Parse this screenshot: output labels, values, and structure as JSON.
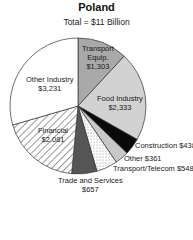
{
  "chart_data": {
    "type": "pie",
    "title": "Poland",
    "subtitle": "Total = $11 Billion",
    "unit": "$ Million",
    "start": "top, clockwise",
    "slices": [
      {
        "label": "Transport Equip.",
        "value": 1303,
        "value_label": "$1,303",
        "fill": "#a9a9a9",
        "pattern": "solid"
      },
      {
        "label": "Food Industry",
        "value": 2333,
        "value_label": "$2,333",
        "fill": "#d2d2d2",
        "pattern": "solid"
      },
      {
        "label": "Construction",
        "value": 438,
        "value_label": "$438",
        "fill": "#0a0a0a",
        "pattern": "solid"
      },
      {
        "label": "Other",
        "value": 361,
        "value_label": "$361",
        "fill": "#c8c8c8",
        "pattern": "solid"
      },
      {
        "label": "Transport/Telecom",
        "value": 548,
        "value_label": "$548",
        "fill": "#ffffff",
        "pattern": "dots"
      },
      {
        "label": "Trade and Services",
        "value": 657,
        "value_label": "$657",
        "fill": "#555555",
        "pattern": "solid"
      },
      {
        "label": "Financial",
        "value": 2081,
        "value_label": "$2,081",
        "fill": "#ffffff",
        "pattern": "hatch"
      },
      {
        "label": "Other Industry",
        "value": 3231,
        "value_label": "$3,231",
        "fill": "#ffffff",
        "pattern": "solid"
      }
    ]
  },
  "labels": {
    "transport_equip": [
      "Transport",
      "Equip.",
      "$1,303"
    ],
    "food": [
      "Food Industry",
      "$2,333"
    ],
    "construction": "Construction $438",
    "other": "Other $361",
    "telecom": "Transport/Telecom  $548",
    "trade": [
      "Trade and Services",
      "$657"
    ],
    "financial": [
      "Financial",
      "$2,081"
    ],
    "other_industry": [
      "Other Industry",
      "$3,231"
    ]
  }
}
